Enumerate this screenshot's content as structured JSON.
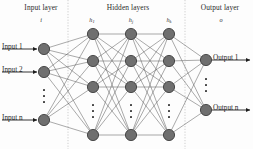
{
  "diagram": {
    "headers": [
      {
        "name": "input-layer-header",
        "label": "Input layer",
        "x": 13,
        "y": 3,
        "w": 56
      },
      {
        "name": "hidden-layers-header",
        "label": "Hidden layers",
        "x": 90,
        "y": 3,
        "w": 76
      },
      {
        "name": "output-layer-header",
        "label": "Output layer",
        "x": 191,
        "y": 3,
        "w": 58
      }
    ],
    "sublabels": [
      {
        "name": "input-layer-symbol",
        "base": "i",
        "sub": "",
        "x": 31,
        "y": 16,
        "w": 20
      },
      {
        "name": "hidden-layer-1-symbol",
        "base": "h",
        "sub": "1",
        "x": 83,
        "y": 16,
        "w": 18
      },
      {
        "name": "hidden-layer-2-symbol",
        "base": "h",
        "sub": "j",
        "x": 122,
        "y": 16,
        "w": 18
      },
      {
        "name": "hidden-layer-3-symbol",
        "base": "h",
        "sub": "k",
        "x": 160,
        "y": 16,
        "w": 18
      },
      {
        "name": "output-layer-symbol",
        "base": "o",
        "sub": "",
        "x": 211,
        "y": 16,
        "w": 20
      }
    ],
    "input_labels": [
      {
        "name": "input-label-1",
        "label": "Input 1",
        "x": 2,
        "y": 43
      },
      {
        "name": "input-label-2",
        "label": "Input 2",
        "x": 2,
        "y": 66
      },
      {
        "name": "input-label-n",
        "label": "Input n",
        "x": 2,
        "y": 114
      }
    ],
    "output_labels": [
      {
        "name": "output-label-1",
        "label": "Output 1",
        "x": 213,
        "y": 54
      },
      {
        "name": "output-label-n",
        "label": "Output n",
        "x": 213,
        "y": 104
      }
    ],
    "colors": {
      "node_fill": "#6f6f6f",
      "node_stroke": "#2f2f2f",
      "edge": "#5a5a5a",
      "divider": "#b9b9b9",
      "arrow": "#1d1d1d",
      "text": "#1d1d1d",
      "background": "#fdfdfd"
    },
    "geometry": {
      "node_radius": 5.6,
      "layers": [
        {
          "name": "input-layer",
          "x": 44,
          "nodes_y": [
            49,
            72,
            120
          ],
          "dots_between": [
            1,
            2
          ]
        },
        {
          "name": "hidden-layer-1",
          "x": 93,
          "nodes_y": [
            34,
            61,
            87,
            135
          ],
          "dots_between": [
            2,
            3
          ]
        },
        {
          "name": "hidden-layer-2",
          "x": 131,
          "nodes_y": [
            34,
            61,
            87,
            135
          ],
          "dots_between": [
            2,
            3
          ]
        },
        {
          "name": "hidden-layer-3",
          "x": 169,
          "nodes_y": [
            34,
            61,
            87,
            135
          ],
          "dots_between": [
            2,
            3
          ]
        },
        {
          "name": "output-layer",
          "x": 206,
          "nodes_y": [
            60,
            110
          ],
          "dots_between": [
            0,
            1
          ]
        }
      ],
      "dividers_x": [
        68,
        185
      ],
      "input_arrows": [
        {
          "name": "input-arrow-1",
          "y": 49,
          "x1": 2,
          "x2": 37
        },
        {
          "name": "input-arrow-2",
          "y": 72,
          "x1": 2,
          "x2": 37
        },
        {
          "name": "input-arrow-n",
          "y": 120,
          "x1": 2,
          "x2": 37
        }
      ],
      "output_arrows": [
        {
          "name": "output-arrow-1",
          "y": 60,
          "x1": 212,
          "x2": 250
        },
        {
          "name": "output-arrow-n",
          "y": 110,
          "x1": 212,
          "x2": 250
        }
      ]
    }
  }
}
